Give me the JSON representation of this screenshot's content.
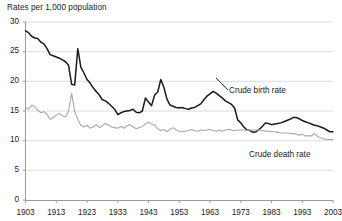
{
  "chart_data": {
    "type": "line",
    "title": "Rates per 1,000 population",
    "xlabel": "",
    "ylabel": "Rates per 1,000 population",
    "xlim": [
      1903,
      2003
    ],
    "ylim": [
      0,
      30
    ],
    "grid": true,
    "legend_position": "inline-annotation",
    "xticks": [
      "1903",
      "1913",
      "1923",
      "1933",
      "1943",
      "1953",
      "1963",
      "1973",
      "1983",
      "1993",
      "2003"
    ],
    "yticks": [
      "0",
      "5",
      "10",
      "15",
      "20",
      "25",
      "30"
    ],
    "annotations": [
      {
        "text": "Crude birth rate",
        "series": "Crude birth rate"
      },
      {
        "text": "Crude death rate",
        "series": "Crude death rate"
      }
    ],
    "x": [
      1903,
      1904,
      1905,
      1906,
      1907,
      1908,
      1909,
      1910,
      1911,
      1912,
      1913,
      1914,
      1915,
      1916,
      1917,
      1918,
      1919,
      1920,
      1921,
      1922,
      1923,
      1924,
      1925,
      1926,
      1927,
      1928,
      1929,
      1930,
      1931,
      1932,
      1933,
      1934,
      1935,
      1936,
      1937,
      1938,
      1939,
      1940,
      1941,
      1942,
      1943,
      1944,
      1945,
      1946,
      1947,
      1948,
      1949,
      1950,
      1951,
      1952,
      1953,
      1954,
      1955,
      1956,
      1957,
      1958,
      1959,
      1960,
      1961,
      1962,
      1963,
      1964,
      1965,
      1966,
      1967,
      1968,
      1969,
      1970,
      1971,
      1972,
      1973,
      1974,
      1975,
      1976,
      1977,
      1978,
      1979,
      1980,
      1981,
      1982,
      1983,
      1984,
      1985,
      1986,
      1987,
      1988,
      1989,
      1990,
      1991,
      1992,
      1993,
      1994,
      1995,
      1996,
      1997,
      1998,
      1999,
      2000,
      2001,
      2002,
      2003
    ],
    "series": [
      {
        "name": "Crude birth rate",
        "color": "#1a1a1a",
        "values": [
          28.5,
          28.2,
          27.6,
          27.3,
          27.2,
          26.6,
          26.3,
          25.5,
          24.5,
          24.3,
          24.1,
          23.9,
          23.6,
          23.3,
          22.7,
          19.5,
          19.4,
          25.5,
          22.4,
          21.4,
          20.3,
          19.7,
          18.9,
          18.3,
          17.7,
          16.9,
          16.7,
          16.3,
          15.8,
          15.3,
          14.4,
          14.7,
          14.9,
          15.0,
          15.1,
          15.3,
          14.8,
          14.7,
          15.0,
          17.2,
          16.5,
          15.9,
          17.7,
          18.2,
          20.3,
          19.0,
          17.0,
          16.0,
          15.8,
          15.6,
          15.5,
          15.6,
          15.4,
          15.3,
          15.5,
          15.6,
          15.9,
          16.2,
          16.9,
          17.5,
          17.9,
          18.3,
          18.0,
          17.6,
          17.2,
          16.7,
          16.4,
          16.1,
          15.5,
          13.5,
          13.0,
          12.3,
          11.8,
          11.7,
          11.4,
          11.5,
          11.9,
          12.4,
          13.0,
          12.9,
          12.7,
          12.8,
          12.9,
          13.0,
          13.2,
          13.4,
          13.6,
          13.9,
          13.9,
          13.7,
          13.4,
          13.2,
          13.0,
          12.8,
          12.6,
          12.5,
          12.3,
          12.1,
          11.8,
          11.5,
          11.5
        ]
      },
      {
        "name": "Crude death rate",
        "color": "#a8a8a8",
        "values": [
          15.6,
          15.3,
          16.0,
          15.7,
          15.1,
          14.7,
          14.9,
          14.4,
          13.6,
          13.9,
          14.3,
          14.6,
          14.2,
          14.0,
          15.0,
          18.0,
          14.9,
          13.6,
          12.6,
          12.3,
          12.6,
          12.1,
          12.3,
          12.7,
          12.2,
          12.5,
          12.9,
          12.6,
          12.3,
          12.2,
          12.1,
          12.4,
          12.1,
          12.5,
          12.7,
          12.3,
          12.0,
          12.2,
          12.4,
          12.8,
          13.1,
          12.8,
          12.6,
          12.0,
          11.7,
          11.9,
          11.5,
          11.9,
          12.2,
          11.8,
          11.6,
          11.5,
          11.6,
          11.7,
          11.9,
          11.7,
          11.6,
          11.8,
          11.7,
          11.8,
          11.9,
          11.7,
          11.6,
          11.8,
          11.6,
          11.8,
          11.9,
          11.8,
          11.7,
          11.8,
          11.8,
          11.8,
          11.7,
          11.8,
          11.8,
          11.8,
          11.8,
          11.7,
          11.6,
          11.6,
          11.5,
          11.5,
          11.4,
          11.3,
          11.3,
          11.3,
          11.2,
          11.2,
          11.1,
          10.9,
          11.1,
          10.8,
          10.8,
          10.8,
          11.2,
          10.7,
          10.5,
          10.3,
          10.2,
          10.2,
          10.2
        ]
      }
    ]
  },
  "axis": {
    "title": "Rates per 1,000 population"
  }
}
